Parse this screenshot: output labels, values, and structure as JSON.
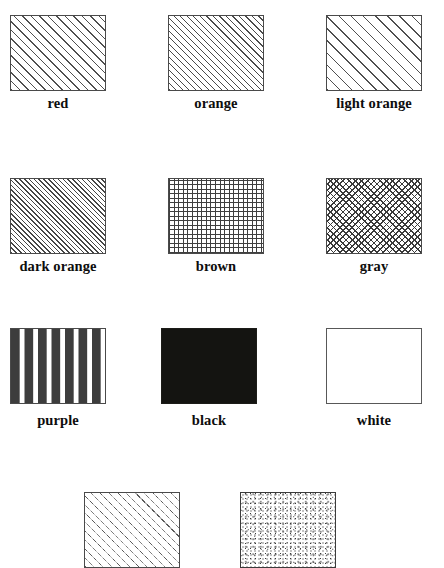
{
  "page": {
    "kind": "map-legend-pattern-sheet",
    "background_color": "#ffffff",
    "width": 444,
    "height": 553,
    "border_color": "#4a4a4a",
    "label_color": "#0d0d0d"
  },
  "legend": {
    "columns": 3,
    "swatch_width": 96,
    "swatch_height": 76,
    "rows": [
      {
        "row_index": 0,
        "top": 15,
        "label_top": 95,
        "cells": [
          {
            "label": "red",
            "left": 10,
            "pattern": "diagonal-hatch-medium",
            "pattern_class": "pat-diag-med",
            "fill_description": "45-degree hatch lines, medium spacing",
            "line_color": "#4f4f4f"
          },
          {
            "label": "orange",
            "left": 168,
            "pattern": "diagonal-hatch-dense",
            "pattern_class": "pat-diag-dense",
            "fill_description": "45-degree hatch lines, dense spacing",
            "line_color": "#4a4a4a"
          },
          {
            "label": "light orange",
            "left": 326,
            "pattern": "diagonal-hatch-wide",
            "pattern_class": "pat-diag-wide",
            "fill_description": "45-degree hatch lines, wide spacing",
            "line_color": "#4f4f4f"
          }
        ]
      },
      {
        "row_index": 1,
        "top": 178,
        "label_top": 258,
        "cells": [
          {
            "label": "dark orange",
            "left": 10,
            "pattern": "diagonal-hatch-very-dense",
            "pattern_class": "pat-diag-verydense",
            "fill_description": "45-degree hatch lines, very dense spacing",
            "line_color": "#454545"
          },
          {
            "label": "brown",
            "left": 168,
            "pattern": "orthogonal-grid",
            "pattern_class": "pat-grid",
            "fill_description": "horizontal and vertical grid lines",
            "line_color": "#3f3f3f"
          },
          {
            "label": "gray",
            "left": 326,
            "pattern": "diagonal-crosshatch",
            "pattern_class": "pat-crosshatch",
            "fill_description": "diagonal cross-hatch diamond lattice",
            "line_color": "#3a3a3a"
          }
        ]
      },
      {
        "row_index": 2,
        "top": 328,
        "label_top": 412,
        "cells": [
          {
            "label": "purple",
            "left": 10,
            "pattern": "horizontal-dashed-lines",
            "pattern_class": "pat-dashed-h",
            "fill_description": "rows of short horizontal dashes",
            "line_color": "#3d3d3d"
          },
          {
            "label": "black",
            "left": 161,
            "pattern": "solid-fill",
            "pattern_class": "pat-solid-black",
            "fill_description": "solid black fill",
            "line_color": "#141411"
          },
          {
            "label": "white",
            "left": 326,
            "pattern": "empty-outline",
            "pattern_class": "pat-empty",
            "fill_description": "no fill, outline only",
            "line_color": "#585858"
          }
        ]
      },
      {
        "row_index": 3,
        "top": 492,
        "label_top": 572,
        "cells": [
          {
            "label": "",
            "left": 84,
            "pattern": "diagonal-dashed-hatch",
            "pattern_class": "pat-diag-dashed",
            "fill_description": "45-degree dashed hatch lines",
            "line_color": "#5a5a5a"
          },
          {
            "label": "",
            "left": 240,
            "pattern": "stipple-dots",
            "pattern_class": "pat-stipple",
            "fill_description": "random fine stippled dots",
            "line_color": "#3b3b3b"
          }
        ]
      }
    ]
  }
}
